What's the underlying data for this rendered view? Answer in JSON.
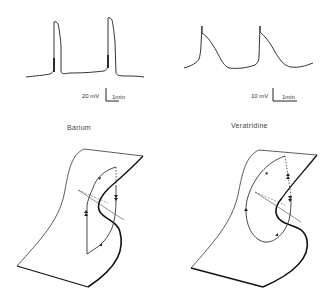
{
  "figure": {
    "left_panel": {
      "title": "Barium",
      "trace": {
        "description": "square-topped action potentials with slow diastolic depolarization",
        "scale_voltage": "20 mV",
        "scale_time": "1min"
      },
      "diagram": {
        "description": "cusp catastrophe fold surface with rectangular limit cycle trajectory"
      }
    },
    "right_panel": {
      "title": "Veratridine",
      "trace": {
        "description": "spike-and-decay oscillations",
        "scale_voltage": "10 mV",
        "scale_time": "1min"
      },
      "diagram": {
        "description": "cusp catastrophe fold surface with elliptical limit cycle trajectory"
      }
    }
  },
  "colors": {
    "line": "#333333",
    "background": "#ffffff"
  }
}
